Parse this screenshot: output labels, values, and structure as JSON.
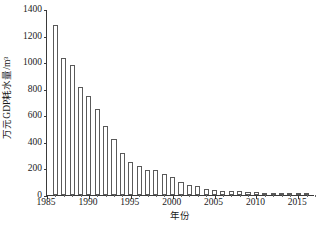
{
  "chart_data": {
    "type": "bar",
    "title": "",
    "xlabel": "年份",
    "ylabel": "万元GDP耗水量/m³",
    "xlim": [
      1985,
      2017
    ],
    "ylim": [
      0,
      1400
    ],
    "yticks": [
      0,
      200,
      400,
      600,
      800,
      1000,
      1200,
      1400
    ],
    "ytick_labels": [
      "0",
      "200",
      "400",
      "600",
      "800",
      "1000",
      "1200",
      "1400"
    ],
    "xticks": [
      1985,
      1990,
      1995,
      2000,
      2005,
      2010,
      2015
    ],
    "xtick_labels": [
      "1985",
      "1990",
      "1995",
      "2000",
      "2005",
      "2010",
      "2015"
    ],
    "grid": false,
    "legend": null,
    "bar_style": {
      "fill": "#ffffff",
      "edge": "#5a5a5a"
    },
    "categories": [
      1986,
      1987,
      1988,
      1989,
      1990,
      1991,
      1992,
      1993,
      1994,
      1995,
      1996,
      1997,
      1998,
      1999,
      2000,
      2001,
      2002,
      2003,
      2004,
      2005,
      2006,
      2007,
      2008,
      2009,
      2010,
      2011,
      2012,
      2013,
      2014,
      2015,
      2016
    ],
    "values": [
      1280,
      1030,
      975,
      815,
      745,
      650,
      520,
      420,
      320,
      245,
      218,
      192,
      185,
      158,
      133,
      100,
      78,
      65,
      45,
      40,
      33,
      30,
      28,
      25,
      20,
      18,
      16,
      15,
      13,
      12,
      10
    ]
  },
  "axes": {
    "frame_color": "#3a3a3a"
  }
}
